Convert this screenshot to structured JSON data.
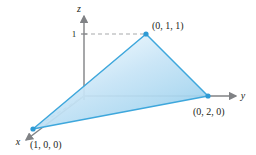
{
  "figure": {
    "background_color": "#ffffff",
    "axes": {
      "x": {
        "label": "x",
        "direction": "down-left",
        "arrow": true
      },
      "y": {
        "label": "y",
        "direction": "right",
        "arrow": true
      },
      "z": {
        "label": "z",
        "direction": "up",
        "arrow": true
      }
    },
    "ticks": [
      {
        "axis": "z",
        "label": "1",
        "value": 1
      }
    ],
    "vertices": [
      {
        "id": "apex",
        "label": "(0, 1, 1)",
        "coords": [
          0,
          1,
          1
        ],
        "px": [
          146,
          34
        ],
        "label_px": [
          152,
          26
        ]
      },
      {
        "id": "y-intercept",
        "label": "(0, 2, 0)",
        "coords": [
          0,
          2,
          0
        ],
        "px": [
          208,
          96
        ],
        "label_px": [
          196,
          110
        ]
      },
      {
        "id": "x-intercept",
        "label": "(1, 0, 0)",
        "coords": [
          1,
          0,
          0
        ],
        "px": [
          33,
          129
        ],
        "label_px": [
          32,
          143
        ]
      }
    ],
    "dashed_guides": [
      {
        "from": "z-axis-at-1",
        "to": "apex"
      },
      {
        "from": "origin",
        "to": "x-intercept"
      },
      {
        "from": "origin",
        "to": "y-intercept"
      }
    ],
    "colors": {
      "edge": "#3ea7dc",
      "fill_light": "#dceffa",
      "fill_mid": "#bcdff4",
      "fill_deep": "#96cfee",
      "axis": "#808285",
      "dash": "#a7a9ac",
      "text": "#231f20",
      "vertex_dot": "#2e9ad4"
    }
  }
}
